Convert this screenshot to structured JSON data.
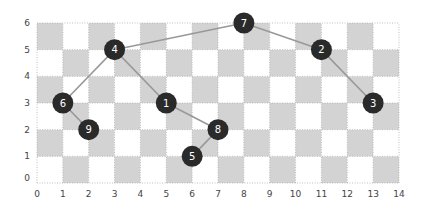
{
  "chart_data": {
    "type": "scatter",
    "title": "",
    "xlabel": "",
    "ylabel": "",
    "xlim": [
      0,
      14
    ],
    "ylim": [
      0,
      6
    ],
    "x_ticks": [
      "0",
      "1",
      "2",
      "3",
      "4",
      "5",
      "6",
      "7",
      "8",
      "9",
      "10",
      "11",
      "12",
      "13",
      "14"
    ],
    "y_ticks": [
      "0",
      "1",
      "2",
      "3",
      "4",
      "5",
      "6"
    ],
    "background": "checkerboard",
    "grid": true,
    "nodes": [
      {
        "id": "1",
        "x": 5,
        "y": 3
      },
      {
        "id": "2",
        "x": 11,
        "y": 5
      },
      {
        "id": "3",
        "x": 13,
        "y": 3
      },
      {
        "id": "4",
        "x": 3,
        "y": 5
      },
      {
        "id": "5",
        "x": 6,
        "y": 1
      },
      {
        "id": "6",
        "x": 1,
        "y": 3
      },
      {
        "id": "7",
        "x": 8,
        "y": 6
      },
      {
        "id": "8",
        "x": 7,
        "y": 2
      },
      {
        "id": "9",
        "x": 2,
        "y": 2
      }
    ],
    "edges": [
      [
        "6",
        "4"
      ],
      [
        "4",
        "7"
      ],
      [
        "7",
        "2"
      ],
      [
        "2",
        "3"
      ],
      [
        "4",
        "1"
      ],
      [
        "1",
        "8"
      ],
      [
        "8",
        "5"
      ],
      [
        "6",
        "9"
      ]
    ]
  },
  "colors": {
    "cell_dark": "#d3d3d3",
    "cell_light": "#ffffff",
    "grid_line": "#b0b0b0",
    "edge": "#999999",
    "node_fill": "#2a2a2a",
    "node_text": "#ffffff"
  }
}
